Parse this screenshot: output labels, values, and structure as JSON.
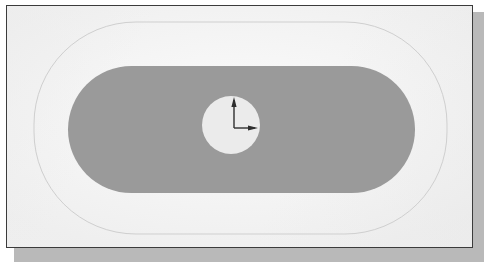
{
  "view": {
    "title": "CAD Model Viewport",
    "background_color": "#fbfbfb",
    "page_color": "#ffffff",
    "border_color": "#3b3b3b",
    "shadow_color": "#b9b9b9"
  },
  "geometry": {
    "outer_boundary": {
      "name": "outer-boundary-outline",
      "shape": "rounded-rectangle",
      "stroke_color": "#cfcfcf",
      "fill": "none",
      "x": 27,
      "y": 16,
      "width": 413,
      "height": 212,
      "corner_radius": 102
    },
    "solid_body": {
      "name": "slot-solid-face",
      "shape": "stadium",
      "fill_color": "#9a9a9a",
      "stroke": "none",
      "x": 61,
      "y": 60,
      "width": 347,
      "height": 127,
      "corner_radius": 63.5
    },
    "hole": {
      "name": "circular-hole",
      "shape": "circle",
      "fill_color": "#ebebeb",
      "stroke": "none",
      "center_x": 224,
      "center_y": 119,
      "radius": 29
    }
  },
  "axis_triad": {
    "name": "origin-axis-indicator",
    "origin_x": 227,
    "origin_y": 122,
    "color": "#2e2e2e",
    "axes": [
      {
        "label": "Y",
        "direction": "up",
        "length": 28
      },
      {
        "label": "X",
        "direction": "right",
        "length": 21
      }
    ]
  }
}
